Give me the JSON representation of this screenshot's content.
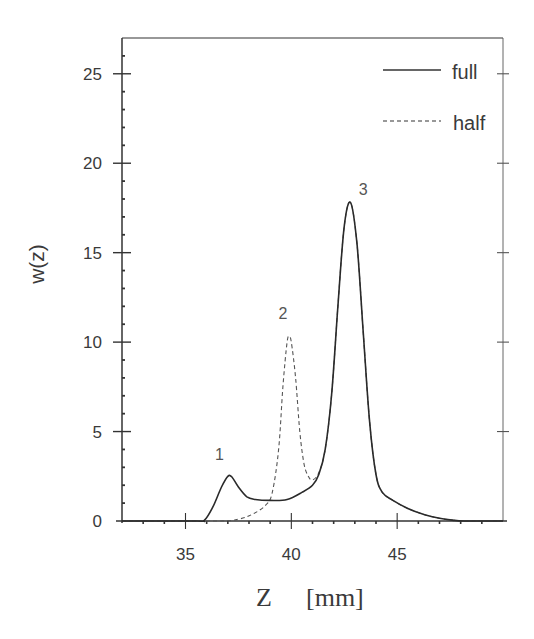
{
  "chart_data": {
    "type": "line",
    "title": "",
    "xlabel": "Z",
    "xunit": "[mm]",
    "ylabel": "w(z)",
    "xlim": [
      32,
      50
    ],
    "ylim": [
      0,
      27
    ],
    "xticks": [
      35,
      40,
      45
    ],
    "yticks": [
      0,
      5,
      10,
      15,
      20,
      25
    ],
    "grid": false,
    "legend_position": "upper right",
    "legend": [
      {
        "label": "full",
        "style": "solid"
      },
      {
        "label": "half",
        "style": "dashed"
      }
    ],
    "annotations": [
      {
        "text": "1",
        "x": 36.6,
        "y": 3.4
      },
      {
        "text": "2",
        "x": 39.6,
        "y": 11.3
      },
      {
        "text": "3",
        "x": 43.4,
        "y": 18.2
      }
    ],
    "series": [
      {
        "name": "full",
        "style": "solid",
        "x": [
          32,
          35.5,
          35.9,
          36.3,
          36.7,
          37.0,
          37.2,
          37.5,
          37.9,
          38.3,
          39.0,
          39.8,
          40.5,
          41.0,
          41.3,
          41.6,
          41.9,
          42.2,
          42.5,
          42.8,
          43.1,
          43.4,
          43.7,
          44.0,
          44.3,
          44.8,
          45.5,
          46.3,
          47.0,
          47.6,
          48.2,
          50
        ],
        "y": [
          0,
          0,
          0.05,
          0.8,
          1.9,
          2.5,
          2.45,
          1.9,
          1.35,
          1.2,
          1.15,
          1.2,
          1.6,
          2.0,
          2.6,
          4.0,
          7.0,
          12.0,
          16.5,
          17.8,
          15.5,
          10.5,
          5.5,
          2.6,
          1.6,
          1.15,
          0.7,
          0.35,
          0.15,
          0.05,
          0,
          0
        ]
      },
      {
        "name": "half",
        "style": "dashed",
        "x": [
          32,
          36.5,
          37.5,
          38.2,
          38.8,
          39.1,
          39.4,
          39.6,
          39.8,
          39.9,
          40.0,
          40.2,
          40.4,
          40.6,
          40.8,
          41.0,
          41.3,
          41.6,
          41.9,
          42.2,
          42.5,
          42.8,
          43.1,
          43.4,
          43.7,
          44.0,
          44.3,
          44.8,
          45.5,
          46.3,
          47.0,
          47.6,
          48.2,
          50
        ],
        "y": [
          0,
          0,
          0.1,
          0.4,
          0.9,
          1.6,
          4.0,
          7.5,
          10.0,
          10.3,
          10.0,
          8.0,
          5.0,
          3.2,
          2.5,
          2.3,
          2.7,
          4.0,
          7.0,
          12.0,
          16.5,
          17.8,
          15.5,
          10.5,
          5.5,
          2.6,
          1.6,
          1.15,
          0.7,
          0.35,
          0.15,
          0.05,
          0,
          0
        ]
      }
    ]
  }
}
